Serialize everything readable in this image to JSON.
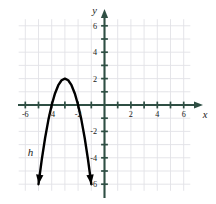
{
  "figure": {
    "title": "",
    "background_color": "#ffffff",
    "axis_color": "#2f4f44",
    "grid_color": "#e2e2e6",
    "curve_color": "#000000",
    "label_color": "#1a1a1a"
  },
  "axes": {
    "x_axis_label": "x",
    "y_axis_label": "y",
    "x_tick_labels": [
      "-6",
      "-4",
      "-2",
      "2",
      "4",
      "6"
    ],
    "x_tick_values": [
      -6,
      -4,
      -2,
      2,
      4,
      6
    ],
    "y_tick_labels": [
      "6",
      "4",
      "2",
      "-2",
      "-4",
      "-6"
    ],
    "y_tick_values": [
      6,
      4,
      2,
      -2,
      -4,
      -6
    ],
    "xlim": [
      -7,
      7
    ],
    "ylim": [
      -7,
      7
    ],
    "grid": true,
    "grid_step": 1
  },
  "curve": {
    "label": "h",
    "label_position": {
      "x": -5.6,
      "y": -3.9
    }
  },
  "chart_data": {
    "type": "line",
    "title": "",
    "xlabel": "x",
    "ylabel": "y",
    "xlim": [
      -7,
      7
    ],
    "ylim": [
      -7,
      7
    ],
    "grid": true,
    "legend": "none",
    "annotations": [
      {
        "text": "h",
        "x": -5.6,
        "y": -3.9,
        "style": "italic"
      }
    ],
    "series": [
      {
        "name": "h",
        "type": "parabola",
        "equation": "y = -2(x + 3)^2 + 2",
        "vertex": [
          -3,
          2
        ],
        "a": -2,
        "x_intercepts": [
          -4,
          -2
        ],
        "arrow_start": [
          -5.0,
          -6.0
        ],
        "arrow_end": [
          -1.0,
          -6.0
        ],
        "x": [
          -5.0,
          -4.75,
          -4.5,
          -4.25,
          -4.0,
          -3.75,
          -3.5,
          -3.25,
          -3.0,
          -2.75,
          -2.5,
          -2.25,
          -2.0,
          -1.75,
          -1.5,
          -1.25,
          -1.0
        ],
        "values": [
          -6.0,
          -4.125,
          -2.5,
          -1.125,
          0.0,
          0.875,
          1.5,
          1.875,
          2.0,
          1.875,
          1.5,
          0.875,
          0.0,
          -1.125,
          -2.5,
          -4.125,
          -6.0
        ]
      }
    ]
  }
}
